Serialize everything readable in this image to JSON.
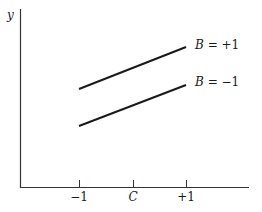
{
  "chart_data": {
    "type": "line",
    "title": "",
    "xlabel": "",
    "ylabel": "y",
    "x_ticks": [
      "-1",
      "C",
      "+1"
    ],
    "x": [
      -1,
      1
    ],
    "series": [
      {
        "name": "B = +1",
        "values": [
          0.45,
          0.75
        ]
      },
      {
        "name": "B = -1",
        "values": [
          0.35,
          0.65
        ]
      }
    ],
    "legend_position": "inline-right",
    "grid": false
  },
  "axes": {
    "y_label": "y",
    "ticks": [
      {
        "label": "−1"
      },
      {
        "label": "C"
      },
      {
        "label": "+1"
      }
    ]
  },
  "lines": [
    {
      "label": "B = +1"
    },
    {
      "label": "B = −1"
    }
  ]
}
